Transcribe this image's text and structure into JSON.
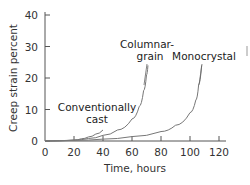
{
  "chart_data": {
    "type": "line",
    "title": "",
    "xlabel": "Time, hours",
    "ylabel": "Creep strain percent",
    "xlim": [
      0,
      120
    ],
    "ylim": [
      0,
      40
    ],
    "x_ticks": [
      "0",
      "20",
      "40",
      "60",
      "80",
      "100",
      "120"
    ],
    "y_ticks": [
      "0",
      "10",
      "20",
      "30",
      "40"
    ],
    "grid": false,
    "legend": "none (curves labeled directly)",
    "series": [
      {
        "name": "Conventionally cast",
        "label_lines": [
          "Conventionally",
          "cast"
        ],
        "x": [
          0,
          10,
          20,
          25,
          30,
          35,
          40
        ],
        "y": [
          0,
          0.1,
          0.3,
          0.7,
          1.3,
          2.2,
          3.5
        ]
      },
      {
        "name": "Columnar-grain",
        "label_lines": [
          "Columnar-",
          "grain"
        ],
        "x": [
          0,
          20,
          30,
          40,
          50,
          60,
          65,
          68,
          70,
          71
        ],
        "y": [
          0,
          0.3,
          0.8,
          1.8,
          3.5,
          7,
          11,
          16,
          21,
          24
        ]
      },
      {
        "name": "Monocrystal",
        "label_lines": [
          "Monocrystal"
        ],
        "x": [
          0,
          20,
          40,
          60,
          80,
          90,
          100,
          104,
          106,
          108
        ],
        "y": [
          0,
          0.2,
          0.6,
          1.4,
          3,
          5,
          9,
          13,
          18,
          24
        ]
      }
    ]
  }
}
